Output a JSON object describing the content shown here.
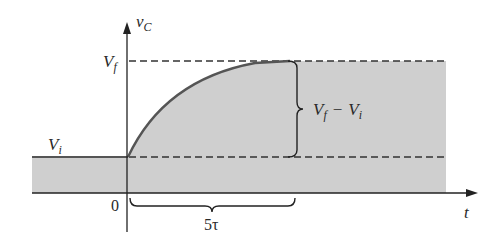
{
  "figure": {
    "type": "capacitor-charging-transient",
    "colors": {
      "background": "#ffffff",
      "shade": "#cfcfcf",
      "curve": "#555555",
      "axis": "#222222",
      "dash": "#333333"
    },
    "axes": {
      "y_label_main": "v",
      "y_label_sub": "C",
      "x_label": "t",
      "origin_label": "0"
    },
    "levels": {
      "final_main": "V",
      "final_sub": "f",
      "initial_main": "V",
      "initial_sub": "i"
    },
    "annotations": {
      "difference": {
        "vf_main": "V",
        "vf_sub": "f",
        "minus": "−",
        "vi_main": "V",
        "vi_sub": "i"
      },
      "duration": "5τ"
    }
  }
}
